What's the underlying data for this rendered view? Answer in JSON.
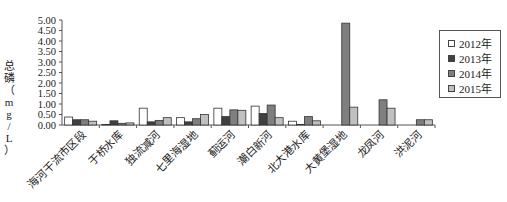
{
  "chart_data": {
    "type": "bar",
    "title": "",
    "xlabel": "",
    "ylabel": "总磷（mg/L）",
    "ylim": [
      0,
      5
    ],
    "yticks": [
      "0.00",
      "0.50",
      "1.00",
      "1.50",
      "2.00",
      "2.50",
      "3.00",
      "3.50",
      "4.00",
      "4.50",
      "5.00"
    ],
    "grid": false,
    "legend_position": "right",
    "categories": [
      "海河干流市区段",
      "于桥水库",
      "独流减河",
      "七里海湿地",
      "蓟运河",
      "潮白新河",
      "北大港水库",
      "大黄堡湿地",
      "龙凤河",
      "洪泥河"
    ],
    "series": [
      {
        "name": "2012年",
        "color": "#ffffff",
        "values": [
          0.38,
          0.02,
          0.8,
          0.35,
          0.8,
          0.9,
          0.18,
          0,
          0,
          0
        ]
      },
      {
        "name": "2013年",
        "color": "#404040",
        "values": [
          0.25,
          0.2,
          0.15,
          0.15,
          0.4,
          0.55,
          0.03,
          0,
          0,
          0
        ]
      },
      {
        "name": "2014年",
        "color": "#7f7f7f",
        "values": [
          0.25,
          0.08,
          0.22,
          0.3,
          0.72,
          0.95,
          0.4,
          4.85,
          1.2,
          0.25
        ]
      },
      {
        "name": "2015年",
        "color": "#c0c0c0",
        "values": [
          0.18,
          0.1,
          0.35,
          0.5,
          0.7,
          0.35,
          0.2,
          0.85,
          0.8,
          0.25
        ]
      }
    ]
  },
  "legend": {
    "items": [
      {
        "label": "2012年",
        "color": "#ffffff"
      },
      {
        "label": "2013年",
        "color": "#404040"
      },
      {
        "label": "2014年",
        "color": "#7f7f7f"
      },
      {
        "label": "2015年",
        "color": "#c0c0c0"
      }
    ]
  },
  "axis": {
    "ylabel_chars": [
      "总",
      "磷",
      "（",
      "m",
      "g",
      "/",
      "L",
      "）"
    ]
  }
}
